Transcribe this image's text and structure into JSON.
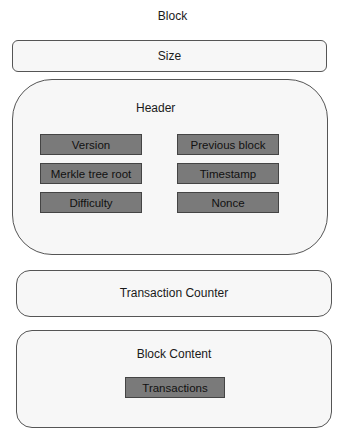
{
  "title": "Block",
  "size_box": {
    "label": "Size"
  },
  "header_box": {
    "label": "Header",
    "fields": [
      {
        "label": "Version"
      },
      {
        "label": "Previous block"
      },
      {
        "label": "Merkle tree root"
      },
      {
        "label": "Timestamp"
      },
      {
        "label": "Difficulty"
      },
      {
        "label": "Nonce"
      }
    ]
  },
  "transaction_counter_box": {
    "label": "Transaction Counter"
  },
  "block_content_box": {
    "label": "Block Content",
    "fields": [
      {
        "label": "Transactions"
      }
    ]
  },
  "colors": {
    "panel_border": "#555555",
    "panel_fill": "#f7f7f7",
    "field_fill": "#7a7a7a"
  }
}
